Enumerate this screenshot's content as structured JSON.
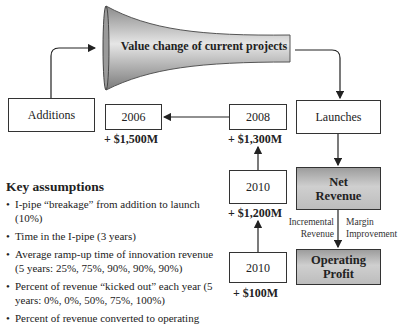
{
  "funnel": {
    "label": "Value change of current projects"
  },
  "nodes": {
    "additions": "Additions",
    "launches": "Launches",
    "y2006": {
      "year": "2006",
      "value": "+ $1,500M"
    },
    "y2008": {
      "year": "2008",
      "value": "+ $1,300M"
    },
    "y2010a": {
      "year": "2010",
      "value": "+ $1,200M"
    },
    "y2010b": {
      "year": "2010",
      "value": "+ $100M"
    },
    "net_revenue": "Net Revenue",
    "operating_profit": "Operating Profit"
  },
  "edge_labels": {
    "left": "Incremental Revenue",
    "right": "Margin Improvement"
  },
  "key_assumptions": {
    "title": "Key assumptions",
    "items": [
      "I-pipe “breakage” from addition to launch (10%)",
      "Time in the I-pipe (3 years)",
      "Average ramp-up time of innovation revenue (5 years: 25%, 75%, 90%, 90%, 90%)",
      "Percent of revenue “kicked out” each year (5 years: 0%, 0%, 50%, 75%, 100%)",
      "Percent of revenue converted to operating"
    ]
  }
}
